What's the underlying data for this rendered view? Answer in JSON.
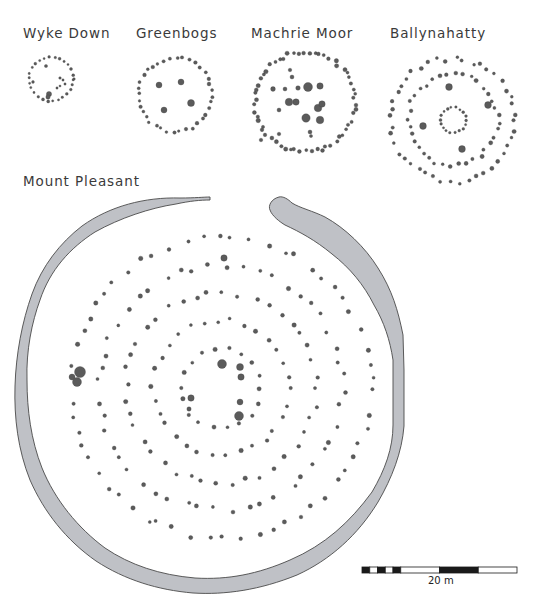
{
  "colors": {
    "ditch_fill": "#bfc1c6",
    "ditch_stroke": "#4a4a4a",
    "post": "#5b5b5b",
    "post_stroke": "#3c3c3c",
    "scale_black": "#1a1a1a"
  },
  "sites": [
    {
      "name": "Wyke Down",
      "label_x": 23,
      "label_y": 25,
      "cx": 51,
      "cy": 79,
      "rings": [
        {
          "r": 22,
          "n": 26,
          "s": 1.3,
          "jit": 0.6
        }
      ],
      "extras": [
        [
          46,
          66,
          1.6
        ],
        [
          33,
          82,
          1.4
        ],
        [
          60,
          78,
          1.3
        ],
        [
          63,
          80,
          1.2
        ],
        [
          57,
          88,
          1.2
        ],
        [
          60,
          86,
          1.1
        ],
        [
          49,
          94,
          2.6
        ],
        [
          48,
          97,
          2.2
        ],
        [
          74,
          79,
          1.3
        ],
        [
          65,
          84,
          1.2
        ]
      ]
    },
    {
      "name": "Greenbogs",
      "label_x": 136,
      "label_y": 25,
      "cx": 175,
      "cy": 95,
      "rings": [
        {
          "r": 37,
          "n": 36,
          "s": 1.6,
          "jit": 1.5
        }
      ],
      "extras": [
        [
          159,
          85,
          3
        ],
        [
          181,
          82,
          3
        ],
        [
          191,
          103,
          3.5
        ],
        [
          164,
          110,
          3
        ]
      ]
    },
    {
      "name": "Machrie Moor",
      "label_x": 251,
      "label_y": 25,
      "cx": 305,
      "cy": 102,
      "rings": [
        {
          "r": 50,
          "n": 58,
          "s": 1.9,
          "jit": 2
        }
      ],
      "extras": [
        [
          308,
          87,
          4.5
        ],
        [
          320,
          86,
          3.2
        ],
        [
          298,
          88,
          2.3
        ],
        [
          289,
          102,
          3.8
        ],
        [
          296,
          102,
          3.2
        ],
        [
          318,
          108,
          3.8
        ],
        [
          322,
          104,
          3.2
        ],
        [
          306,
          118,
          4.2
        ],
        [
          320,
          120,
          3.8
        ],
        [
          273,
          89,
          2.4
        ],
        [
          285,
          89,
          2
        ],
        [
          279,
          110,
          2
        ],
        [
          292,
          77,
          2
        ],
        [
          290,
          70,
          1.8
        ],
        [
          310,
          132,
          2
        ],
        [
          311,
          136,
          1.6
        ],
        [
          279,
          134,
          1.8
        ],
        [
          261,
          140,
          1.8
        ]
      ]
    },
    {
      "name": "Ballynahatty",
      "label_x": 390,
      "label_y": 25,
      "cx": 453,
      "cy": 120,
      "rings": [
        {
          "r": 62,
          "n": 44,
          "s": 1.8,
          "jit": 3
        },
        {
          "r": 45,
          "n": 36,
          "s": 1.8,
          "jit": 2.5
        },
        {
          "r": 13,
          "n": 18,
          "s": 1.3,
          "jit": 1
        }
      ],
      "extras": [
        [
          449,
          87,
          3.4
        ],
        [
          488,
          105,
          3.4
        ],
        [
          423,
          126,
          3.4
        ],
        [
          462,
          149,
          3.4
        ]
      ]
    }
  ],
  "mount_pleasant": {
    "title": "Mount Pleasant",
    "label_x": 23,
    "label_y": 173,
    "cx": 221,
    "cy": 388,
    "rings": [
      {
        "r": 150,
        "n": 58,
        "s": 1.9,
        "jit": 3
      },
      {
        "r": 122,
        "n": 48,
        "s": 1.9,
        "jit": 3
      },
      {
        "r": 95,
        "n": 40,
        "s": 1.9,
        "jit": 3
      },
      {
        "r": 68,
        "n": 30,
        "s": 1.9,
        "jit": 2.5
      },
      {
        "r": 40,
        "n": 18,
        "s": 1.9,
        "jit": 2
      }
    ],
    "extras": [
      [
        72,
        377,
        3
      ],
      [
        80,
        372,
        5.5
      ],
      [
        77,
        382,
        4.5
      ],
      [
        224,
        258,
        3.2
      ],
      [
        222,
        364,
        4.5
      ],
      [
        240,
        367,
        3.5
      ],
      [
        241,
        377,
        3.2
      ],
      [
        240,
        402,
        3
      ],
      [
        239,
        416,
        4.5
      ],
      [
        191,
        398,
        3.2
      ],
      [
        189,
        409,
        2.2
      ]
    ]
  },
  "scale_bar": {
    "x": 362,
    "y": 567,
    "width": 155,
    "height": 6,
    "label": "20 m",
    "label_x": 428,
    "label_y": 575
  }
}
